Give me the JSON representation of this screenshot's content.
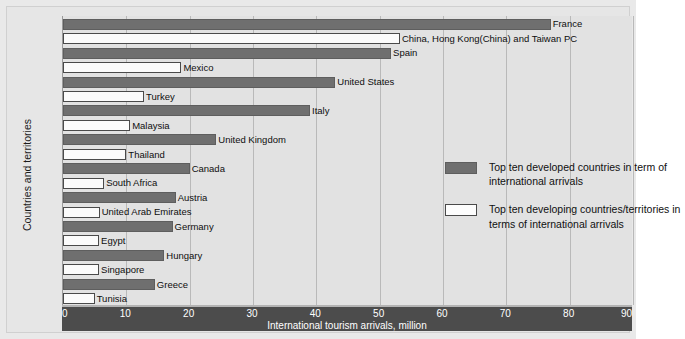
{
  "chart_data": {
    "type": "bar",
    "orientation": "horizontal",
    "title": "",
    "xlabel": "International tourism arrivals, million",
    "ylabel": "Countries and territories",
    "xlim": [
      0,
      90
    ],
    "xticks": [
      0,
      10,
      20,
      30,
      40,
      50,
      60,
      70,
      80,
      90
    ],
    "grid": true,
    "legend_position": "center-right",
    "colors": {
      "developed": "#6f6f6f",
      "developing": "#fbfbfb",
      "axis_strip": "#4c4c4c",
      "plot_background": "#e2e2e2",
      "figure_background": "#e6e6e6"
    },
    "series": [
      {
        "name": "Top ten developed countries in term of international arrivals",
        "key": "developed",
        "categories": [
          "France",
          "Spain",
          "United States",
          "Italy",
          "United Kingdom",
          "Canada",
          "Austria",
          "Germany",
          "Hungary",
          "Greece"
        ],
        "values": [
          77.0,
          51.8,
          43.0,
          39.0,
          24.2,
          20.0,
          17.8,
          17.3,
          16.0,
          14.5
        ]
      },
      {
        "name": "Top ten developing countries/territories in terms of international arrivals",
        "key": "developing",
        "categories": [
          "China, Hong Kong(China) and Taiwan PC",
          "Mexico",
          "Turkey",
          "Malaysia",
          "Thailand",
          "South Africa",
          "United Arab Emirates",
          "Egypt",
          "Singapore",
          "Tunisia"
        ],
        "values": [
          53.2,
          18.7,
          12.8,
          10.6,
          10.0,
          6.5,
          5.8,
          5.7,
          5.7,
          5.0
        ]
      }
    ],
    "bars": [
      {
        "label": "France",
        "value": 77.0,
        "group": "developed"
      },
      {
        "label": "China, Hong Kong(China) and Taiwan PC",
        "value": 53.2,
        "group": "developing"
      },
      {
        "label": "Spain",
        "value": 51.8,
        "group": "developed"
      },
      {
        "label": "Mexico",
        "value": 18.7,
        "group": "developing"
      },
      {
        "label": "United States",
        "value": 43.0,
        "group": "developed"
      },
      {
        "label": "Turkey",
        "value": 12.8,
        "group": "developing"
      },
      {
        "label": "Italy",
        "value": 39.0,
        "group": "developed"
      },
      {
        "label": "Malaysia",
        "value": 10.6,
        "group": "developing"
      },
      {
        "label": "United Kingdom",
        "value": 24.2,
        "group": "developed"
      },
      {
        "label": "Thailand",
        "value": 10.0,
        "group": "developing"
      },
      {
        "label": "Canada",
        "value": 20.0,
        "group": "developed"
      },
      {
        "label": "South Africa",
        "value": 6.5,
        "group": "developing"
      },
      {
        "label": "Austria",
        "value": 17.8,
        "group": "developed"
      },
      {
        "label": "United Arab Emirates",
        "value": 5.8,
        "group": "developing"
      },
      {
        "label": "Germany",
        "value": 17.3,
        "group": "developed"
      },
      {
        "label": "Egypt",
        "value": 5.7,
        "group": "developing"
      },
      {
        "label": "Hungary",
        "value": 16.0,
        "group": "developed"
      },
      {
        "label": "Singapore",
        "value": 5.7,
        "group": "developing"
      },
      {
        "label": "Greece",
        "value": 14.5,
        "group": "developed"
      },
      {
        "label": "Tunisia",
        "value": 5.0,
        "group": "developing"
      }
    ],
    "legend": [
      {
        "group": "developed",
        "text": "Top ten developed countries in term of international arrivals"
      },
      {
        "group": "developing",
        "text": "Top ten developing countries/territories in terms of international arrivals"
      }
    ]
  }
}
